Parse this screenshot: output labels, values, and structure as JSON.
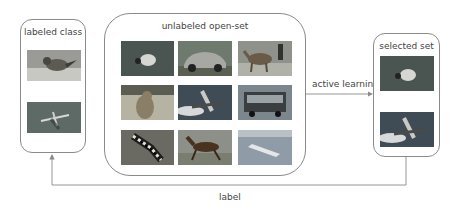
{
  "labeled_class": {
    "title": "labeled class",
    "images": [
      {
        "subject": "bird"
      },
      {
        "subject": "airplane"
      }
    ]
  },
  "unlabeled_open_set": {
    "title": "unlabeled open-set",
    "images": [
      {
        "subject": "bird"
      },
      {
        "subject": "car"
      },
      {
        "subject": "deer"
      },
      {
        "subject": "cat"
      },
      {
        "subject": "airplane"
      },
      {
        "subject": "truck"
      },
      {
        "subject": "frog"
      },
      {
        "subject": "horse"
      },
      {
        "subject": "ship"
      }
    ]
  },
  "selected_set": {
    "title": "selected set",
    "images": [
      {
        "subject": "bird"
      },
      {
        "subject": "airplane"
      }
    ]
  },
  "edges": {
    "active_learning": "active learning",
    "label": "label"
  },
  "colors": {
    "border": "#8a8a8a",
    "arrow": "#8a8a8a",
    "text": "#444444"
  }
}
